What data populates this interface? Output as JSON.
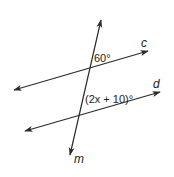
{
  "diagram": {
    "colors": {
      "line": "#2a2a2a",
      "text": "#222222",
      "background": "#ffffff"
    },
    "lines": [
      {
        "name": "c",
        "label": "c",
        "from": [
          14,
          90
        ],
        "to": [
          148,
          51
        ]
      },
      {
        "name": "d",
        "label": "d",
        "from": [
          25,
          131
        ],
        "to": [
          160,
          92
        ]
      },
      {
        "name": "m",
        "label": "m",
        "from": [
          101,
          20
        ],
        "to": [
          70,
          155
        ]
      }
    ],
    "angles": [
      {
        "id": "angle-top",
        "label": "60°",
        "at_intersection": "m-c"
      },
      {
        "id": "angle-bottom",
        "label": "(2x + 10)°",
        "at_intersection": "m-d"
      }
    ],
    "line_labels": {
      "c": "c",
      "d": "d",
      "m": "m"
    },
    "angle_labels": {
      "top": "60°",
      "bottom": "(2x + 10)°"
    }
  }
}
